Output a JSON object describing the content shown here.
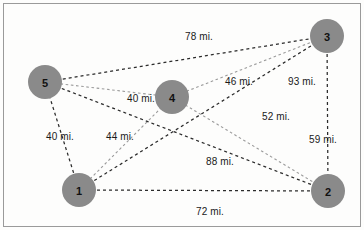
{
  "figure": {
    "background_color": "#fdfdfc",
    "border_color": "#9a9a9a",
    "node_color": "#8a8a8a",
    "edge_color": "#2b2b2b",
    "edge_color_light": "#9b9b9b"
  },
  "chart_data": {
    "type": "diagram",
    "title": "",
    "xlabel": "",
    "ylabel": "",
    "nodes": [
      {
        "id": "1",
        "label": "1",
        "x": 79,
        "y": 190,
        "r": 17
      },
      {
        "id": "2",
        "label": "2",
        "x": 328,
        "y": 191,
        "r": 17
      },
      {
        "id": "3",
        "label": "3",
        "x": 327,
        "y": 36,
        "r": 17
      },
      {
        "id": "4",
        "label": "4",
        "x": 172,
        "y": 97,
        "r": 17
      },
      {
        "id": "5",
        "label": "5",
        "x": 45,
        "y": 82,
        "r": 17
      }
    ],
    "edges": [
      {
        "from": "5",
        "to": "3",
        "weight": 78,
        "label": "78 mi.",
        "label_x": 185,
        "label_y": 31,
        "style": "dark"
      },
      {
        "from": "5",
        "to": "4",
        "weight": 40,
        "label": "40 mi.",
        "label_x": 127,
        "label_y": 93,
        "style": "light"
      },
      {
        "from": "4",
        "to": "3",
        "weight": 46,
        "label": "46 mi.",
        "label_x": 225,
        "label_y": 76,
        "style": "light"
      },
      {
        "from": "1",
        "to": "3",
        "weight": 93,
        "label": "93 mi.",
        "label_x": 288,
        "label_y": 76,
        "style": "dark"
      },
      {
        "from": "1",
        "to": "5",
        "weight": 40,
        "label": "40 mi.",
        "label_x": 46,
        "label_y": 131,
        "style": "dark"
      },
      {
        "from": "1",
        "to": "4",
        "weight": 44,
        "label": "44 mi.",
        "label_x": 106,
        "label_y": 131,
        "style": "light"
      },
      {
        "from": "4",
        "to": "2",
        "weight": 52,
        "label": "52 mi.",
        "label_x": 262,
        "label_y": 111,
        "style": "light"
      },
      {
        "from": "3",
        "to": "2",
        "weight": 59,
        "label": "59 mi.",
        "label_x": 309,
        "label_y": 134,
        "style": "dark"
      },
      {
        "from": "5",
        "to": "2",
        "weight": 88,
        "label": "88 mi.",
        "label_x": 206,
        "label_y": 156,
        "style": "dark"
      },
      {
        "from": "1",
        "to": "2",
        "weight": 72,
        "label": "72 mi.",
        "label_x": 196,
        "label_y": 206,
        "style": "dark"
      }
    ],
    "units": "mi."
  }
}
